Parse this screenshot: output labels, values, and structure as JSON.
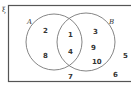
{
  "diagram": {
    "type": "venn",
    "universal_label": "ξ",
    "sets": [
      {
        "name": "A",
        "only": [
          "2",
          "8"
        ]
      },
      {
        "name": "B",
        "only": [
          "3",
          "9",
          "10"
        ]
      }
    ],
    "intersection": [
      "1",
      "4"
    ],
    "outside": [
      "5",
      "7",
      "6"
    ],
    "colors": {
      "stroke": "#555555",
      "text": "#333333"
    }
  }
}
